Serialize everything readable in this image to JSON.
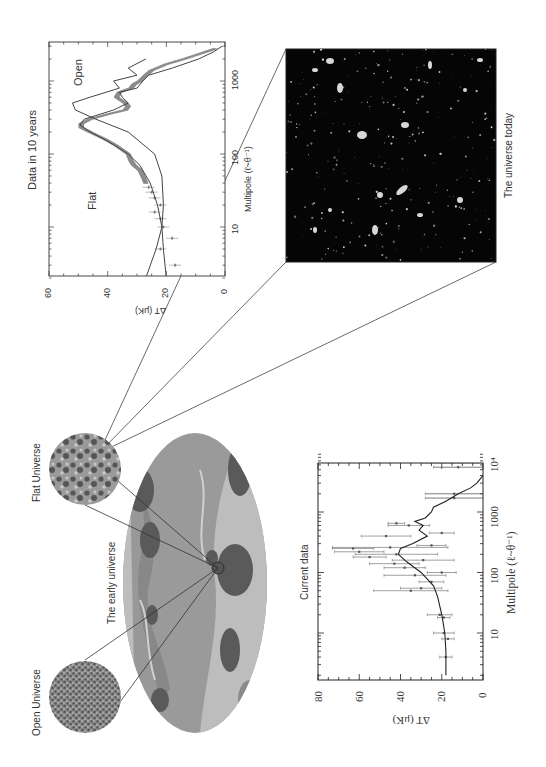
{
  "figure": {
    "labels": {
      "open_universe": "Open Universe",
      "flat_universe": "Flat Universe",
      "early_universe": "The early universe",
      "universe_today": "The universe today"
    },
    "colors": {
      "sky_base": "#9a9a9a",
      "sky_light": "#c4c4c4",
      "sky_dark": "#5a5a5a",
      "photo_bg": "#050505",
      "data_grey": "#8c8c8c",
      "line": "#333333"
    }
  },
  "chart_data": [
    {
      "type": "line",
      "title": "Data  in 10 years",
      "xlabel": "Multipole (ℓ~θ⁻¹)",
      "ylabel": "ΔT  (μK)",
      "x_scale": "log",
      "xlim": [
        2,
        3000
      ],
      "ylim": [
        0,
        60
      ],
      "x_ticks": [
        "10",
        "100",
        "1000"
      ],
      "y_ticks": [
        "0",
        "20",
        "40",
        "60"
      ],
      "annotations": [
        "Flat",
        "Open"
      ],
      "series": [
        {
          "name": "Flat",
          "x": [
            2,
            5,
            10,
            20,
            40,
            70,
            100,
            150,
            200,
            250,
            300,
            400,
            500,
            600,
            700,
            800,
            1000,
            1200,
            1500,
            2000,
            2500,
            3000
          ],
          "values": [
            20,
            21,
            21.5,
            23,
            25.5,
            29,
            33,
            40,
            46,
            49.5,
            48,
            38,
            33,
            35,
            36,
            30,
            28,
            26,
            18,
            9,
            4,
            1
          ]
        },
        {
          "name": "Open",
          "x": [
            2,
            5,
            10,
            20,
            50,
            100,
            200,
            300,
            400,
            500,
            600,
            800,
            1000,
            1200,
            1500,
            2000
          ],
          "values": [
            27,
            23.5,
            21.5,
            21,
            21.5,
            24,
            33,
            44,
            51,
            52,
            46,
            36,
            38,
            30,
            33,
            27
          ]
        }
      ],
      "data_points": {
        "name": "Simulated data",
        "x": [
          3,
          5,
          7,
          10,
          13,
          16,
          20,
          25,
          30,
          35,
          40,
          50,
          60,
          70,
          80,
          100,
          130,
          160,
          200,
          230,
          260,
          300,
          350,
          400,
          450,
          500,
          600,
          700,
          800,
          900,
          1000,
          1200,
          1400,
          1700,
          2000,
          2400,
          2800
        ],
        "values": [
          17,
          22,
          18,
          21,
          22,
          24,
          22,
          24,
          25,
          26,
          27,
          28,
          29,
          31,
          32,
          33,
          37,
          41,
          46,
          49,
          49,
          46,
          40,
          34,
          33,
          34,
          37,
          36,
          32,
          31,
          29,
          27,
          25,
          20,
          14,
          8,
          3
        ]
      }
    },
    {
      "type": "scatter",
      "title": "Current data",
      "xlabel": "Multipole (ℓ~θ⁻¹)",
      "ylabel": "ΔT    (μK)",
      "x_scale": "log",
      "xlim": [
        2,
        10000
      ],
      "ylim": [
        0,
        80
      ],
      "x_ticks": [
        "10",
        "100",
        "1000",
        "10⁴"
      ],
      "y_ticks": [
        "0",
        "20",
        "40",
        "60",
        "80"
      ],
      "theory_curve": {
        "x": [
          2,
          5,
          10,
          20,
          40,
          60,
          100,
          150,
          200,
          250,
          300,
          400,
          500,
          600,
          700,
          800,
          1000,
          1200,
          1500,
          2000,
          2500,
          3000,
          4000
        ],
        "values": [
          18,
          18,
          18.5,
          20,
          22,
          24,
          30,
          37,
          41,
          40,
          34,
          27,
          31,
          29,
          33,
          28,
          25,
          24,
          18,
          12,
          6,
          3,
          0
        ]
      },
      "data_points": [
        {
          "x": 4,
          "y": 18,
          "err": 3
        },
        {
          "x": 8,
          "y": 17,
          "err": 3
        },
        {
          "x": 10,
          "y": 19,
          "err": 5
        },
        {
          "x": 18,
          "y": 19,
          "err": 3
        },
        {
          "x": 20,
          "y": 21,
          "err": 6
        },
        {
          "x": 50,
          "y": 35,
          "err": 18
        },
        {
          "x": 55,
          "y": 30,
          "err": 10
        },
        {
          "x": 70,
          "y": 25,
          "err": 6
        },
        {
          "x": 90,
          "y": 33,
          "err": 15
        },
        {
          "x": 100,
          "y": 20,
          "err": 7
        },
        {
          "x": 120,
          "y": 38,
          "err": 10
        },
        {
          "x": 140,
          "y": 43,
          "err": 12
        },
        {
          "x": 160,
          "y": 29,
          "err": 15
        },
        {
          "x": 180,
          "y": 55,
          "err": 8
        },
        {
          "x": 200,
          "y": 42,
          "err": 20
        },
        {
          "x": 220,
          "y": 60,
          "err": 12
        },
        {
          "x": 250,
          "y": 63,
          "err": 10
        },
        {
          "x": 260,
          "y": 45,
          "err": 28
        },
        {
          "x": 280,
          "y": 25,
          "err": 7
        },
        {
          "x": 400,
          "y": 47,
          "err": 12
        },
        {
          "x": 450,
          "y": 20,
          "err": 6
        },
        {
          "x": 600,
          "y": 36,
          "err": 10
        },
        {
          "x": 650,
          "y": 42,
          "err": 4
        },
        {
          "x": 1700,
          "y": 14,
          "err": 14
        },
        {
          "x": 2000,
          "y": 14,
          "err": 14
        },
        {
          "x": 5500,
          "y": 12,
          "err": 12
        },
        {
          "x": 6500,
          "y": 15,
          "err": 15
        },
        {
          "x": 7500,
          "y": 10,
          "err": 10
        },
        {
          "x": 9000,
          "y": 27,
          "err": 27
        }
      ]
    }
  ]
}
